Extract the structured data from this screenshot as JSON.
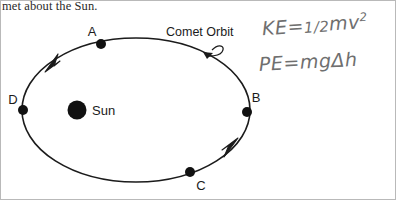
{
  "header": {
    "text": "met about the Sun."
  },
  "diagram": {
    "orbit_label": "Comet Orbit",
    "sun_label": "Sun",
    "sun": {
      "cx": 77,
      "cy": 110,
      "r": 9.5,
      "color": "#111111"
    },
    "orbit": {
      "cx": 136,
      "cy": 110,
      "rx": 114,
      "ry": 72,
      "stroke": "#1b1b1b",
      "stroke_width": 1.6
    },
    "points": [
      {
        "id": "A",
        "label": "A",
        "x": 101,
        "y": 44,
        "label_x": 92,
        "label_y": 36
      },
      {
        "id": "B",
        "label": "B",
        "x": 247,
        "y": 112,
        "label_x": 252,
        "label_y": 102
      },
      {
        "id": "C",
        "label": "C",
        "x": 190,
        "y": 172,
        "label_x": 199,
        "label_y": 190
      },
      {
        "id": "D",
        "label": "D",
        "x": 23,
        "y": 110,
        "label_x": 8,
        "label_y": 104
      }
    ],
    "direction_arrows": [
      {
        "id": "arrow-upper-left",
        "x": 55,
        "y": 58
      },
      {
        "id": "arrow-lower-right",
        "x": 228,
        "y": 152
      }
    ]
  },
  "annotations": {
    "kinetic_energy": {
      "lhs": "KE",
      "equals": "=",
      "fraction": "1/2",
      "mass": "m",
      "velocity": "v",
      "exponent": "2",
      "full": "KE = 1/2 m v^2"
    },
    "potential_energy": {
      "lhs": "PE",
      "equals": "=",
      "mass": "m",
      "gravity": "g",
      "delta": "Δ",
      "height": "h",
      "full": "PE = mgΔh"
    }
  }
}
